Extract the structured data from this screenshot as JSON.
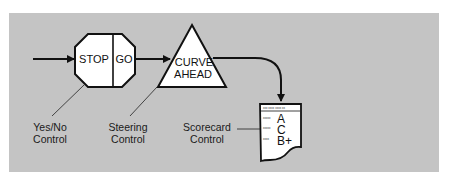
{
  "diagram": {
    "background_color": "#c4c4c4",
    "stroke_color": "#111111",
    "shapes": {
      "stop_sign": {
        "left_text": "STOP",
        "right_text": "GO"
      },
      "curve_sign": {
        "line1": "CURVE",
        "line2": "AHEAD"
      },
      "scorecard": {
        "header": "xxx xxxx  xxxx  xx",
        "rows": [
          {
            "label": "xxxxx",
            "grade": "A"
          },
          {
            "label": "xxxxx",
            "grade": "C"
          },
          {
            "label": "xxxx",
            "grade": "B+"
          }
        ]
      }
    },
    "labels": {
      "yes_no": {
        "line1": "Yes/No",
        "line2": "Control"
      },
      "steering": {
        "line1": "Steering",
        "line2": "Control"
      },
      "scorecard": {
        "line1": "Scorecard",
        "line2": "Control"
      }
    }
  }
}
